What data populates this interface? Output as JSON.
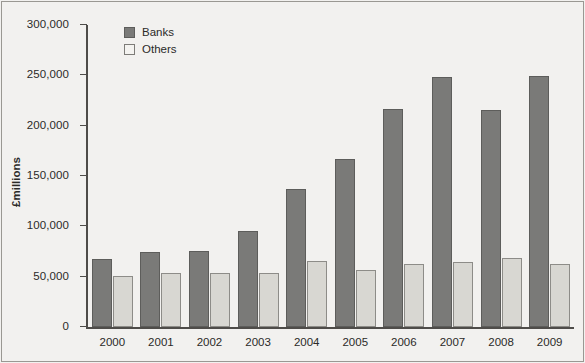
{
  "chart_data": {
    "type": "bar",
    "title": "",
    "xlabel": "",
    "ylabel": "£millions",
    "ylim": [
      0,
      300000
    ],
    "ytick_labels": [
      "300,000",
      "250,000",
      "200,000",
      "150,000",
      "100,000",
      "50,000",
      "0"
    ],
    "ytick_values": [
      300000,
      250000,
      200000,
      150000,
      100000,
      50000,
      0
    ],
    "grid": false,
    "legend_position": "top-left inside",
    "categories": [
      "2000",
      "2001",
      "2002",
      "2003",
      "2004",
      "2005",
      "2006",
      "2007",
      "2008",
      "2009"
    ],
    "series": [
      {
        "name": "Banks",
        "color": "#7a7a78",
        "values": [
          68000,
          75000,
          76000,
          95000,
          137000,
          167000,
          217000,
          248000,
          216000,
          249000
        ]
      },
      {
        "name": "Others",
        "color": "#d8d7d2",
        "values": [
          51000,
          54000,
          54000,
          54000,
          66000,
          57000,
          63000,
          65000,
          69000,
          63000
        ]
      }
    ]
  },
  "legend": {
    "items": [
      {
        "label": "Banks",
        "swatch": "filled-square-dark"
      },
      {
        "label": "Others",
        "swatch": "outlined-square-light"
      }
    ]
  },
  "colors": {
    "banks": "#7a7a78",
    "others": "#d8d7d2",
    "axis": "#4e4c49",
    "text": "#2b2a28",
    "background": "#f2f1ef"
  }
}
